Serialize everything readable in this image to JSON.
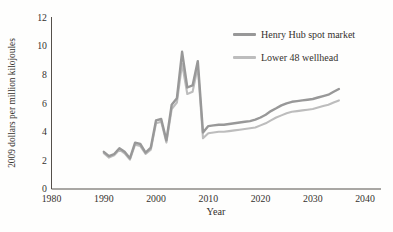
{
  "figure": {
    "background_color": "#fefefd",
    "text_color": "#35312d",
    "axis_color": "#55504b"
  },
  "chart_data": {
    "type": "line",
    "title": "",
    "xlabel": "Year",
    "ylabel": "2009 dollars per million kilojoules",
    "xlim": [
      1980,
      2040
    ],
    "ylim": [
      0,
      12
    ],
    "x_ticks": [
      1980,
      1990,
      2000,
      2010,
      2020,
      2030,
      2040
    ],
    "y_ticks": [
      0,
      2,
      4,
      6,
      8,
      10,
      12
    ],
    "grid": false,
    "legend_position": "top-right",
    "x": [
      1990,
      1991,
      1992,
      1993,
      1994,
      1995,
      1996,
      1997,
      1998,
      1999,
      2000,
      2001,
      2002,
      2003,
      2004,
      2005,
      2006,
      2007,
      2008,
      2009,
      2010,
      2011,
      2012,
      2013,
      2014,
      2015,
      2016,
      2017,
      2018,
      2019,
      2020,
      2021,
      2022,
      2023,
      2024,
      2025,
      2026,
      2027,
      2028,
      2029,
      2030,
      2031,
      2032,
      2033,
      2034,
      2035
    ],
    "series": [
      {
        "name": "Henry Hub spot market",
        "color": "#989898",
        "values": [
          2.6,
          2.3,
          2.45,
          2.85,
          2.6,
          2.15,
          3.25,
          3.15,
          2.55,
          2.9,
          4.8,
          4.9,
          3.4,
          5.9,
          6.35,
          9.6,
          7.1,
          7.25,
          8.95,
          3.95,
          4.4,
          4.45,
          4.5,
          4.5,
          4.55,
          4.6,
          4.65,
          4.7,
          4.75,
          4.85,
          5.0,
          5.2,
          5.45,
          5.65,
          5.85,
          6.0,
          6.1,
          6.15,
          6.2,
          6.25,
          6.3,
          6.4,
          6.5,
          6.6,
          6.8,
          7.0
        ]
      },
      {
        "name": "Lower 48 wellhead",
        "color": "#bdbdbd",
        "values": [
          2.5,
          2.2,
          2.35,
          2.75,
          2.5,
          2.05,
          3.1,
          3.0,
          2.45,
          2.75,
          4.6,
          4.7,
          3.25,
          5.6,
          6.05,
          8.75,
          6.65,
          6.8,
          8.55,
          3.55,
          3.9,
          3.95,
          4.0,
          4.0,
          4.05,
          4.1,
          4.15,
          4.2,
          4.25,
          4.3,
          4.45,
          4.6,
          4.8,
          5.0,
          5.15,
          5.3,
          5.4,
          5.45,
          5.5,
          5.55,
          5.6,
          5.7,
          5.8,
          5.9,
          6.05,
          6.2
        ]
      }
    ]
  }
}
